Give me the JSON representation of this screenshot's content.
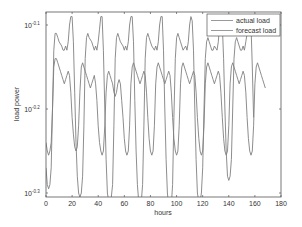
{
  "chart_data": {
    "type": "line",
    "title": "",
    "xlabel": "hours",
    "ylabel": "load power",
    "xlim": [
      0,
      180
    ],
    "ylim_log10": [
      -0.31,
      -0.085
    ],
    "yscale": "log",
    "grid": false,
    "legend_position": "upper right",
    "x_ticks": [
      "0",
      "20",
      "40",
      "60",
      "80",
      "100",
      "120",
      "140",
      "160",
      "180"
    ],
    "y_ticks": [
      {
        "base": "10",
        "exp": "-0.1",
        "log10": -0.1
      },
      {
        "base": "10",
        "exp": "-0.2",
        "log10": -0.2
      },
      {
        "base": "10",
        "exp": "-0.3",
        "log10": -0.3
      }
    ],
    "series": [
      {
        "name": "actual load",
        "color": "#808080",
        "x": [
          0,
          1,
          2,
          3,
          4,
          5,
          6,
          7,
          8,
          9,
          10,
          12,
          13,
          14,
          15,
          16,
          17,
          18,
          19,
          20,
          21,
          22,
          23,
          24,
          25,
          26,
          27,
          28,
          29,
          30,
          31,
          32,
          33,
          35,
          36,
          37,
          38,
          39,
          40,
          41,
          42,
          43,
          44,
          45,
          46,
          47,
          48,
          49,
          50,
          51,
          52,
          53,
          54,
          55,
          56,
          57,
          59,
          60,
          61,
          62,
          63,
          64,
          65,
          66,
          67,
          68,
          69,
          70,
          71,
          72,
          73,
          74,
          75,
          76,
          77,
          78,
          79,
          80,
          81,
          83,
          84,
          85,
          86,
          87,
          88,
          89,
          90,
          91,
          92,
          93,
          94,
          95,
          96,
          97,
          98,
          99,
          100,
          101,
          102,
          103,
          104,
          105,
          107,
          108,
          109,
          110,
          111,
          112,
          113,
          114,
          115,
          116,
          117,
          118,
          119,
          120,
          121,
          122,
          123,
          124,
          125,
          126,
          127,
          128,
          129,
          131,
          132,
          133,
          134,
          135,
          136,
          137,
          138,
          139,
          140,
          141,
          142,
          143,
          144,
          145,
          146,
          147,
          148,
          149,
          150,
          151,
          152,
          153,
          155,
          156,
          157,
          158,
          159,
          160,
          161,
          162,
          163,
          164,
          165,
          166,
          167,
          168
        ],
        "log10": [
          -0.27,
          -0.29,
          -0.295,
          -0.29,
          -0.27,
          -0.2,
          -0.13,
          -0.11,
          -0.11,
          -0.115,
          -0.12,
          -0.125,
          -0.13,
          -0.13,
          -0.125,
          -0.13,
          -0.12,
          -0.1,
          -0.09,
          -0.09,
          -0.12,
          -0.18,
          -0.24,
          -0.28,
          -0.3,
          -0.305,
          -0.3,
          -0.28,
          -0.22,
          -0.14,
          -0.115,
          -0.11,
          -0.115,
          -0.12,
          -0.125,
          -0.13,
          -0.125,
          -0.13,
          -0.12,
          -0.105,
          -0.09,
          -0.09,
          -0.13,
          -0.2,
          -0.26,
          -0.3,
          -0.31,
          -0.31,
          -0.305,
          -0.29,
          -0.22,
          -0.14,
          -0.115,
          -0.11,
          -0.115,
          -0.12,
          -0.125,
          -0.13,
          -0.125,
          -0.13,
          -0.12,
          -0.1,
          -0.09,
          -0.09,
          -0.12,
          -0.19,
          -0.25,
          -0.29,
          -0.31,
          -0.315,
          -0.31,
          -0.29,
          -0.22,
          -0.14,
          -0.115,
          -0.11,
          -0.115,
          -0.12,
          -0.125,
          -0.13,
          -0.125,
          -0.13,
          -0.12,
          -0.1,
          -0.09,
          -0.09,
          -0.13,
          -0.2,
          -0.26,
          -0.3,
          -0.315,
          -0.32,
          -0.315,
          -0.29,
          -0.21,
          -0.14,
          -0.115,
          -0.11,
          -0.115,
          -0.12,
          -0.125,
          -0.13,
          -0.125,
          -0.13,
          -0.12,
          -0.1,
          -0.09,
          -0.095,
          -0.13,
          -0.2,
          -0.26,
          -0.3,
          -0.31,
          -0.31,
          -0.3,
          -0.27,
          -0.2,
          -0.14,
          -0.12,
          -0.115,
          -0.12,
          -0.125,
          -0.13,
          -0.13,
          -0.125,
          -0.13,
          -0.12,
          -0.1,
          -0.09,
          -0.1,
          -0.14,
          -0.2,
          -0.25,
          -0.28,
          -0.285,
          -0.28,
          -0.26,
          -0.2,
          -0.14,
          -0.12,
          -0.115,
          -0.12,
          -0.125,
          -0.13,
          -0.13,
          -0.125,
          -0.13,
          -0.12,
          -0.1,
          -0.09,
          -0.1,
          -0.15,
          -0.21
        ]
      },
      {
        "name": "forecast load",
        "color": "#808080",
        "x": [
          0,
          1,
          2,
          3,
          4,
          5,
          6,
          7,
          8,
          9,
          10,
          11,
          12,
          13,
          14,
          15,
          16,
          17,
          18,
          19,
          20,
          21,
          22,
          23,
          24,
          25,
          26,
          27,
          28,
          29,
          30,
          31,
          32,
          33,
          34,
          35,
          36,
          37,
          38,
          39,
          40,
          41,
          42,
          43,
          44,
          45,
          46,
          47,
          48,
          49,
          50,
          51,
          52,
          53,
          54,
          55,
          56,
          57,
          58,
          59,
          60,
          61,
          62,
          63,
          64,
          65,
          66,
          67,
          68,
          69,
          70,
          71,
          72,
          73,
          74,
          75,
          76,
          77,
          78,
          79,
          80,
          81,
          82,
          83,
          84,
          85,
          86,
          87,
          88,
          89,
          90,
          91,
          92,
          93,
          94,
          95,
          96,
          97,
          98,
          99,
          100,
          101,
          102,
          103,
          104,
          105,
          106,
          107,
          108,
          109,
          110,
          111,
          112,
          113,
          114,
          115,
          116,
          117,
          118,
          119,
          120,
          121,
          122,
          123,
          124,
          125,
          126,
          127,
          128,
          129,
          130,
          131,
          132,
          133,
          134,
          135,
          136,
          137,
          138,
          139,
          140,
          141,
          142,
          143,
          144,
          145,
          146,
          147,
          148,
          149,
          150,
          151,
          152,
          153,
          154,
          155,
          156,
          157,
          158,
          159,
          160,
          161,
          162,
          163,
          164,
          165,
          166,
          167,
          168
        ],
        "log10": [
          -0.24,
          -0.25,
          -0.255,
          -0.25,
          -0.24,
          -0.2,
          -0.15,
          -0.14,
          -0.14,
          -0.145,
          -0.15,
          -0.155,
          -0.16,
          -0.165,
          -0.17,
          -0.165,
          -0.16,
          -0.155,
          -0.16,
          -0.18,
          -0.21,
          -0.23,
          -0.245,
          -0.25,
          -0.245,
          -0.22,
          -0.18,
          -0.15,
          -0.145,
          -0.15,
          -0.155,
          -0.16,
          -0.165,
          -0.17,
          -0.175,
          -0.17,
          -0.165,
          -0.16,
          -0.17,
          -0.19,
          -0.22,
          -0.24,
          -0.25,
          -0.255,
          -0.25,
          -0.22,
          -0.18,
          -0.16,
          -0.155,
          -0.16,
          -0.165,
          -0.17,
          -0.18,
          -0.185,
          -0.18,
          -0.17,
          -0.165,
          -0.17,
          -0.19,
          -0.21,
          -0.235,
          -0.25,
          -0.255,
          -0.25,
          -0.22,
          -0.17,
          -0.15,
          -0.145,
          -0.15,
          -0.155,
          -0.16,
          -0.165,
          -0.17,
          -0.165,
          -0.16,
          -0.155,
          -0.16,
          -0.18,
          -0.21,
          -0.235,
          -0.25,
          -0.255,
          -0.25,
          -0.22,
          -0.17,
          -0.15,
          -0.145,
          -0.15,
          -0.155,
          -0.16,
          -0.165,
          -0.17,
          -0.165,
          -0.16,
          -0.155,
          -0.16,
          -0.18,
          -0.21,
          -0.235,
          -0.25,
          -0.255,
          -0.25,
          -0.22,
          -0.17,
          -0.15,
          -0.145,
          -0.15,
          -0.155,
          -0.16,
          -0.165,
          -0.17,
          -0.165,
          -0.16,
          -0.155,
          -0.16,
          -0.18,
          -0.21,
          -0.235,
          -0.25,
          -0.255,
          -0.25,
          -0.22,
          -0.17,
          -0.15,
          -0.145,
          -0.15,
          -0.155,
          -0.16,
          -0.165,
          -0.17,
          -0.165,
          -0.16,
          -0.155,
          -0.16,
          -0.18,
          -0.21,
          -0.235,
          -0.25,
          -0.255,
          -0.25,
          -0.22,
          -0.17,
          -0.15,
          -0.145,
          -0.15,
          -0.155,
          -0.16,
          -0.165,
          -0.17,
          -0.165,
          -0.16,
          -0.155,
          -0.16,
          -0.18,
          -0.21,
          -0.235,
          -0.25,
          -0.255,
          -0.25,
          -0.22,
          -0.17,
          -0.15,
          -0.145,
          -0.15,
          -0.155,
          -0.16,
          -0.165,
          -0.17,
          -0.175,
          -0.18,
          -0.2,
          -0.25
        ]
      }
    ]
  },
  "legend": {
    "items": [
      {
        "label": "actual load"
      },
      {
        "label": "forecast load"
      }
    ]
  },
  "axes": {
    "xlabel": "hours",
    "ylabel": "load power"
  }
}
